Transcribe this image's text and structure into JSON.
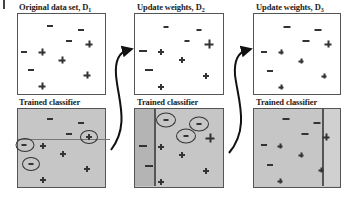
{
  "panels": [
    {
      "top_title": "Original data set,",
      "top_symbol": "D",
      "top_subscript": "1",
      "bottom_title": "Trained classifier"
    },
    {
      "top_title": "Update weights,",
      "top_symbol": "D",
      "top_subscript": "2",
      "bottom_title": "Trained classifier"
    },
    {
      "top_title": "Update weights,",
      "top_symbol": "D",
      "top_subscript": "3",
      "bottom_title": "Trained classifier"
    }
  ],
  "legend": {
    "positive": "+",
    "negative": "−"
  },
  "colors": {
    "classifier_bg": "#c6c6c6",
    "border": "#555555",
    "marks": "#333333"
  }
}
